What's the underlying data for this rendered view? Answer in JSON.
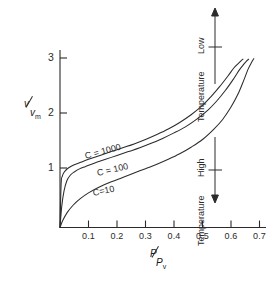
{
  "chart_data": {
    "type": "line",
    "title": "",
    "subtitle": "",
    "xlabel": "P / P_v",
    "ylabel": "v / v_m",
    "xlabel_num": "P",
    "xlabel_den": "P",
    "xlabel_den_sub": "v",
    "ylabel_num": "v",
    "ylabel_den": "v",
    "ylabel_den_sub": "m",
    "xlim": [
      0,
      0.73
    ],
    "ylim": [
      0,
      3.3
    ],
    "grid": false,
    "legend_position": "inline-curve-labels",
    "xticks": [
      0.1,
      0.2,
      0.3,
      0.4,
      0.5,
      0.6,
      0.7
    ],
    "xtick_labels": [
      "0.1",
      "0.2",
      "0.3",
      "0.4",
      "0.5",
      "0.6",
      "0.7"
    ],
    "yticks": [
      1,
      2,
      3
    ],
    "ytick_labels": [
      "1",
      "2",
      "3"
    ],
    "series": [
      {
        "name": "C = 1000",
        "label": "C = 1000",
        "x": [
          0.0,
          0.004,
          0.008,
          0.014,
          0.022,
          0.032,
          0.05,
          0.07,
          0.1,
          0.14,
          0.18,
          0.22,
          0.26,
          0.3,
          0.34,
          0.38,
          0.42,
          0.46,
          0.5,
          0.53,
          0.56,
          0.59,
          0.61,
          0.625,
          0.635,
          0.642
        ],
        "y": [
          0.0,
          0.8,
          0.93,
          1.0,
          1.05,
          1.09,
          1.14,
          1.18,
          1.24,
          1.31,
          1.38,
          1.45,
          1.52,
          1.6,
          1.69,
          1.79,
          1.91,
          2.05,
          2.22,
          2.38,
          2.56,
          2.76,
          2.9,
          2.98,
          3.03,
          3.06
        ]
      },
      {
        "name": "C = 100",
        "label": "C = 100",
        "x": [
          0.0,
          0.006,
          0.014,
          0.024,
          0.036,
          0.05,
          0.07,
          0.09,
          0.12,
          0.16,
          0.2,
          0.24,
          0.28,
          0.32,
          0.36,
          0.4,
          0.44,
          0.48,
          0.52,
          0.55,
          0.58,
          0.61,
          0.63,
          0.645,
          0.655,
          0.662
        ],
        "y": [
          0.0,
          0.38,
          0.66,
          0.85,
          0.95,
          1.01,
          1.07,
          1.11,
          1.17,
          1.24,
          1.31,
          1.38,
          1.45,
          1.53,
          1.62,
          1.72,
          1.83,
          1.97,
          2.14,
          2.3,
          2.49,
          2.71,
          2.87,
          2.97,
          3.03,
          3.06
        ]
      },
      {
        "name": "C = 10",
        "label": "C=10",
        "x": [
          0.0,
          0.01,
          0.025,
          0.045,
          0.07,
          0.1,
          0.14,
          0.18,
          0.22,
          0.26,
          0.3,
          0.34,
          0.38,
          0.42,
          0.46,
          0.5,
          0.54,
          0.57,
          0.6,
          0.625,
          0.645,
          0.66,
          0.672,
          0.68
        ],
        "y": [
          0.0,
          0.13,
          0.27,
          0.4,
          0.52,
          0.63,
          0.74,
          0.83,
          0.91,
          0.99,
          1.07,
          1.15,
          1.24,
          1.34,
          1.46,
          1.6,
          1.79,
          1.96,
          2.19,
          2.43,
          2.68,
          2.88,
          3.0,
          3.07
        ]
      }
    ],
    "annotations": [
      {
        "id": "low-temperature",
        "word1": "Low",
        "word2": "Temperature",
        "arrow": "up"
      },
      {
        "id": "high-temperature",
        "word1": "High",
        "word2": "Temperature",
        "arrow": "down"
      }
    ],
    "colors": {
      "ink": "#2b2b2b",
      "background": "#ffffff"
    }
  }
}
